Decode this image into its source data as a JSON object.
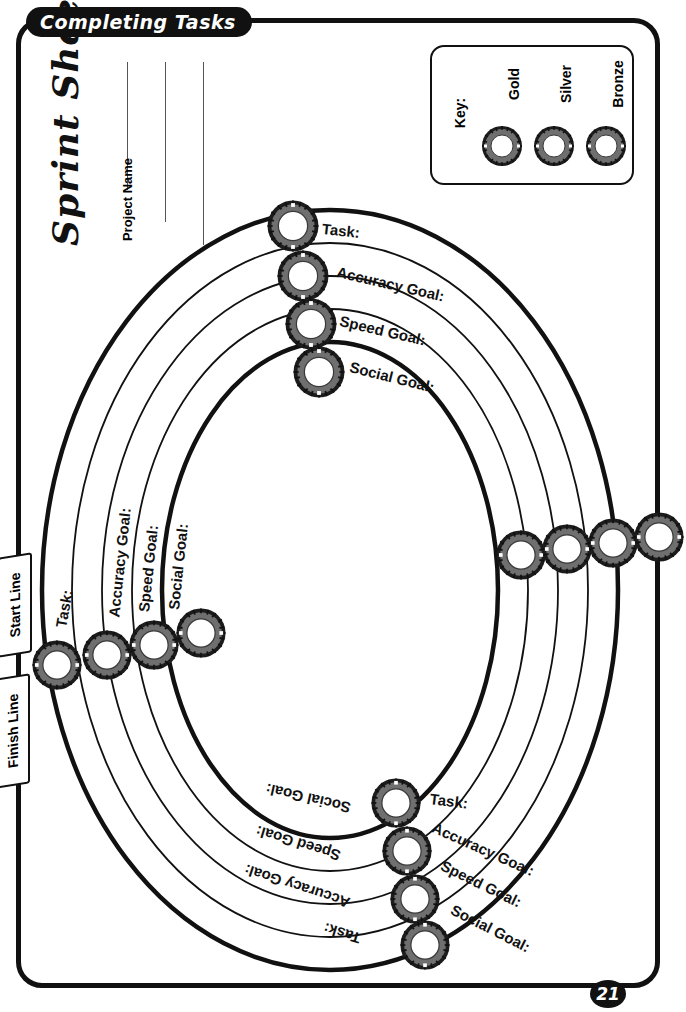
{
  "header": {
    "banner_title": "Completing Tasks"
  },
  "title": {
    "sheet_title": "Sprint Sheet"
  },
  "project": {
    "label": "Project Name",
    "line_count": 3
  },
  "key": {
    "label": "Key:",
    "items": [
      {
        "label": "Gold",
        "icon": "gear-ring-icon"
      },
      {
        "label": "Silver",
        "icon": "gear-ring-icon"
      },
      {
        "label": "Bronze",
        "icon": "gear-ring-icon"
      }
    ]
  },
  "ribbons": {
    "start": "Start Line",
    "finish": "Finish Line"
  },
  "tracks": {
    "names": [
      "Task:",
      "Accuracy Goal:",
      "Speed Goal:",
      "Social Goal:"
    ],
    "top_right": [
      "Task:",
      "Accuracy Goal:",
      "Speed Goal:",
      "Social Goal:"
    ],
    "left": [
      "Task:",
      "Accuracy Goal:",
      "Speed Goal:",
      "Social Goal:"
    ],
    "bottom_right": [
      "Task:",
      "Accuracy Goal:",
      "Speed Goal:",
      "Social Goal:"
    ],
    "bottom_left_inverted": [
      "Social Goal:",
      "Speed Goal:",
      "Accuracy Goal:",
      "Task:"
    ]
  },
  "footer": {
    "page_number": "21"
  },
  "colors": {
    "ink": "#111111",
    "paper": "#ffffff",
    "gear_body": "#6f6f6f",
    "gear_teeth": "#1c1c1c",
    "rule_line": "#555555"
  }
}
